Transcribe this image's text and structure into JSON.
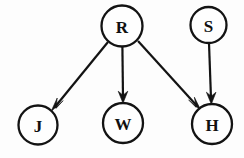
{
  "diagram": {
    "type": "directed-graph",
    "background_color": "#fdfdfd",
    "stroke_color": "#131313",
    "node_fill_color": "#fefefe",
    "nodes": [
      {
        "id": "R",
        "label": "R",
        "cx": 122,
        "cy": 26,
        "r": 21
      },
      {
        "id": "S",
        "label": "S",
        "cx": 208,
        "cy": 25,
        "r": 18
      },
      {
        "id": "J",
        "label": "J",
        "cx": 38,
        "cy": 125,
        "r": 20
      },
      {
        "id": "W",
        "label": "W",
        "cx": 123,
        "cy": 123,
        "r": 20
      },
      {
        "id": "H",
        "label": "H",
        "cx": 212,
        "cy": 124,
        "r": 20
      }
    ],
    "edges": [
      {
        "from": "R",
        "to": "J",
        "x1": 108,
        "y1": 42,
        "x2": 52,
        "y2": 110
      },
      {
        "from": "R",
        "to": "W",
        "x1": 122,
        "y1": 47,
        "x2": 123,
        "y2": 101
      },
      {
        "from": "R",
        "to": "H",
        "x1": 138,
        "y1": 41,
        "x2": 200,
        "y2": 109
      },
      {
        "from": "S",
        "to": "H",
        "x1": 209,
        "y1": 43,
        "x2": 211,
        "y2": 102
      }
    ]
  }
}
